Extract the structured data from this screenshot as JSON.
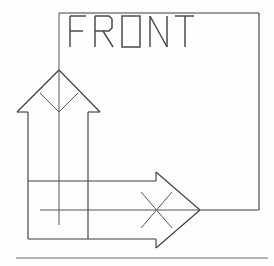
{
  "drawing": {
    "label": "FRONT",
    "label_chars": [
      "F",
      "R",
      "O",
      "N",
      "T"
    ],
    "label_note": "stencil-style technical lettering; the letter O is drawn as a square",
    "view_type": "orientation-indicator",
    "background_color": "#fefefe",
    "line_color": "#3d3d44",
    "accent_line_color": "#55555c",
    "rule_color": "#6a6a72",
    "canvas": {
      "width": 274,
      "height": 266
    },
    "elements": {
      "frame": {
        "name": "view-box",
        "description": "open square outline enclosing the FRONT label",
        "left": 59,
        "top": 13,
        "right": 259,
        "bottom": 210
      },
      "up_arrow": {
        "name": "up-arrow",
        "direction": "up",
        "tip_x": 59,
        "tip_y": 70,
        "head_left_x": 17,
        "head_right_x": 100,
        "head_base_y": 112,
        "shaft_left_x": 28,
        "shaft_right_x": 88,
        "shaft_bottom_y": 238,
        "marker": "chevron"
      },
      "right_arrow": {
        "name": "right-arrow",
        "direction": "right",
        "tip_x": 200,
        "tip_y": 210,
        "head_top_y": 172,
        "head_bottom_y": 248,
        "head_back_x": 156,
        "shaft_top_y": 181,
        "shaft_bottom_y": 239,
        "shaft_left_x": 28,
        "marker": "cross"
      },
      "centerline_vertical": {
        "name": "vertical-centerline",
        "x": 59,
        "y1": 13,
        "y2": 225
      },
      "centerline_horizontal": {
        "name": "horizontal-centerline",
        "y": 210,
        "x1": 40,
        "x2": 259
      },
      "baseline_rule": {
        "name": "baseline-rule",
        "y": 258,
        "x1": 16,
        "x2": 268
      }
    }
  },
  "a11y": {
    "figure_caption": "Technical line drawing: square view frame labelled FRONT, with an upward arrow bearing a chevron mark and a rightward arrow bearing an X mark."
  }
}
